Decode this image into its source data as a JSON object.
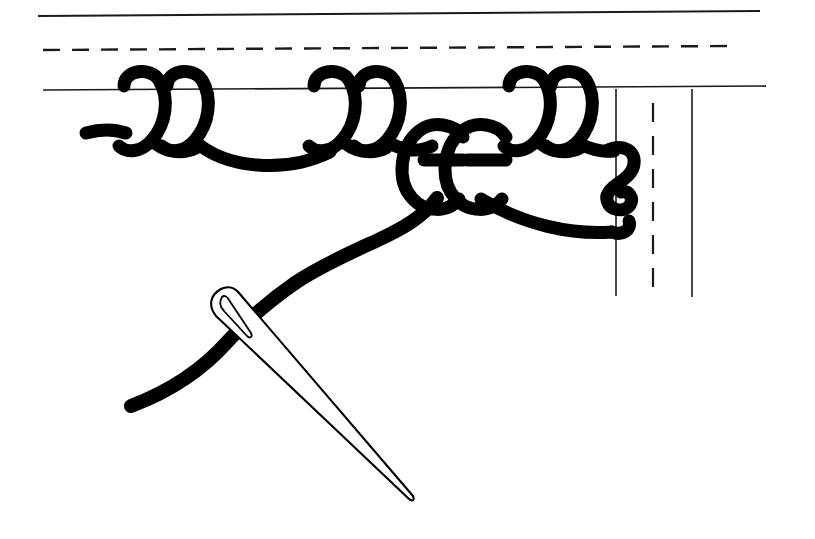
{
  "figure": {
    "title": "Blanket stitch worked along a fabric edge with threaded needle",
    "style": "black-and-white line art",
    "background_color": "#ffffff",
    "ink_color": "#000000"
  },
  "canvas": {
    "width": 815,
    "height": 539
  },
  "fabric": {
    "description": "Three horizontal guide lines representing the folded fabric edge, with three vertical lines at the right end",
    "horizontal_lines": [
      {
        "name": "top-fold-line",
        "style": "solid",
        "y_left": 16,
        "y_right": 11,
        "x_start": 38,
        "x_end": 760,
        "stroke_width": 2.0
      },
      {
        "name": "fold-crease-line",
        "style": "dashed",
        "y_left": 50,
        "y_right": 46,
        "x_start": 43,
        "x_end": 732,
        "stroke_width": 2.4,
        "dash": "17 12"
      },
      {
        "name": "fabric-edge-line",
        "style": "solid",
        "y_left": 90,
        "y_right": 86,
        "x_start": 43,
        "x_end": 766,
        "stroke_width": 1.6
      }
    ],
    "vertical_lines": [
      {
        "name": "vertical-edge-line-left",
        "style": "solid",
        "x": 616,
        "y_start": 89,
        "y_end": 296,
        "stroke_width": 1.6
      },
      {
        "name": "vertical-crease-line-dashed",
        "style": "dashed",
        "x": 653,
        "y_start": 103,
        "y_end": 293,
        "stroke_width": 2.2,
        "dash": "19 14"
      },
      {
        "name": "vertical-edge-line-right",
        "style": "solid",
        "x": 692,
        "y_start": 89,
        "y_end": 297,
        "stroke_width": 1.6
      }
    ]
  },
  "stitches": {
    "thread_stroke_width": 13,
    "completed_loop_count": 6,
    "completed_loops": [
      {
        "index": 1,
        "center_x": 140,
        "top_y": 75,
        "bottom_y": 152
      },
      {
        "index": 2,
        "center_x": 183,
        "top_y": 75,
        "bottom_y": 152
      },
      {
        "index": 3,
        "center_x": 330,
        "top_y": 75,
        "bottom_y": 152
      },
      {
        "index": 4,
        "center_x": 375,
        "top_y": 75,
        "bottom_y": 152
      },
      {
        "index": 5,
        "center_x": 525,
        "top_y": 75,
        "bottom_y": 152
      },
      {
        "index": 6,
        "center_x": 567,
        "top_y": 75,
        "bottom_y": 152
      }
    ],
    "active_loops": [
      {
        "index": 7,
        "label": "pulled-loop-left",
        "center_x": 440,
        "top_y": 122,
        "bottom_y": 212
      },
      {
        "index": 8,
        "label": "pulled-loop-right",
        "center_x": 482,
        "top_y": 122,
        "bottom_y": 212
      }
    ],
    "thread_tail_start": {
      "x": 88,
      "y": 131
    },
    "working_thread_end": {
      "x": 128,
      "y": 408
    },
    "right_edge_s_curve": {
      "x": 612,
      "y_top": 150,
      "y_bottom": 232
    }
  },
  "needle": {
    "name": "sewing-needle",
    "eye_position": {
      "x": 218,
      "y": 293
    },
    "point_position": {
      "x": 412,
      "y": 503
    },
    "angle_degrees": 47,
    "fill": "#ffffff",
    "outline": "#000000"
  }
}
